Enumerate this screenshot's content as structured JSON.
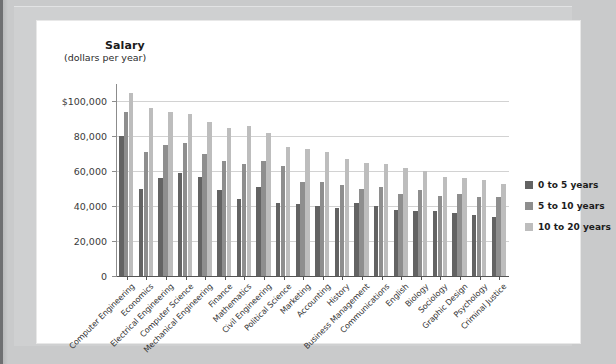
{
  "chart_data": {
    "type": "bar",
    "title": "Salary",
    "subtitle": "(dollars per year)",
    "xlabel": "",
    "ylabel": "Salary (dollars per year)",
    "ylim": [
      0,
      110000
    ],
    "grid": true,
    "legend_position": "right",
    "ytick_labels": [
      "$100,000",
      "80,000",
      "60,000",
      "40,000",
      "20,000",
      "0"
    ],
    "ytick_values": [
      100000,
      80000,
      60000,
      40000,
      20000,
      0
    ],
    "categories": [
      "Computer Engineering",
      "Economics",
      "Electrical Engineering",
      "Computer Science",
      "Mechanical Engineering",
      "Finance",
      "Mathematics",
      "Civil Engineering",
      "Political Science",
      "Marketing",
      "Accounting",
      "History",
      "Business Management",
      "Communications",
      "English",
      "Biology",
      "Sociology",
      "Graphic Design",
      "Psychology",
      "Criminal Justice"
    ],
    "series": [
      {
        "name": "0 to 5 years",
        "color": "#636363",
        "values": [
          80000,
          50000,
          56000,
          59000,
          57000,
          49000,
          44000,
          51000,
          42000,
          41000,
          40000,
          39000,
          42000,
          40000,
          38000,
          37000,
          37000,
          36000,
          35000,
          34000
        ]
      },
      {
        "name": "5 to 10 years",
        "color": "#8e8e8e",
        "values": [
          94000,
          71000,
          75000,
          76000,
          70000,
          66000,
          64000,
          66000,
          63000,
          54000,
          54000,
          52000,
          50000,
          51000,
          47000,
          49000,
          46000,
          47000,
          45000,
          45000
        ]
      },
      {
        "name": "10 to 20 years",
        "color": "#bdbdbd",
        "values": [
          105000,
          96000,
          94000,
          93000,
          88000,
          85000,
          86000,
          82000,
          74000,
          73000,
          71000,
          67000,
          65000,
          64000,
          62000,
          60000,
          57000,
          56000,
          55000,
          53000
        ]
      }
    ]
  },
  "legend": {
    "items": [
      {
        "label": "0 to 5 years",
        "color": "#636363"
      },
      {
        "label": "5 to 10 years",
        "color": "#8e8e8e"
      },
      {
        "label": "10 to 20 years",
        "color": "#bdbdbd"
      }
    ]
  }
}
